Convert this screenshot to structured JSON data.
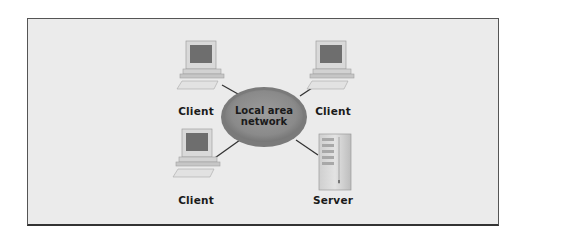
{
  "diagram": {
    "type": "network-topology",
    "center": {
      "label_line1": "Local area",
      "label_line2": "network",
      "fill": "#8a8a8a"
    },
    "nodes": [
      {
        "id": "client-top-left",
        "label": "Client",
        "kind": "computer"
      },
      {
        "id": "client-top-right",
        "label": "Client",
        "kind": "computer"
      },
      {
        "id": "client-bottom-left",
        "label": "Client",
        "kind": "computer"
      },
      {
        "id": "server-bottom-right",
        "label": "Server",
        "kind": "server"
      }
    ],
    "edges": [
      [
        "client-top-left",
        "lan"
      ],
      [
        "client-top-right",
        "lan"
      ],
      [
        "client-bottom-left",
        "lan"
      ],
      [
        "server-bottom-right",
        "lan"
      ]
    ]
  }
}
